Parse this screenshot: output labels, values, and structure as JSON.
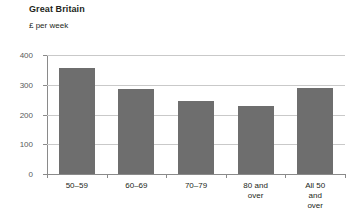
{
  "chart_data": {
    "type": "bar",
    "title": "Great Britain",
    "subtitle": "£ per week",
    "xlabel": "",
    "ylabel": "",
    "categories": [
      "50–59",
      "60–69",
      "70–79",
      "80 and\nover",
      "All 50\nand over"
    ],
    "values": [
      355,
      285,
      245,
      230,
      290
    ],
    "ylim": [
      0,
      400
    ],
    "yticks": [
      "0",
      "100",
      "200",
      "300",
      "400"
    ],
    "ytick_values": [
      0,
      100,
      200,
      300,
      400
    ],
    "grid": true,
    "legend": "none",
    "bar_color": "#6e6e6e",
    "gridline_color": "#c9c9c9",
    "axis_color": "#8a8a8a",
    "text_color": "#231f20"
  }
}
